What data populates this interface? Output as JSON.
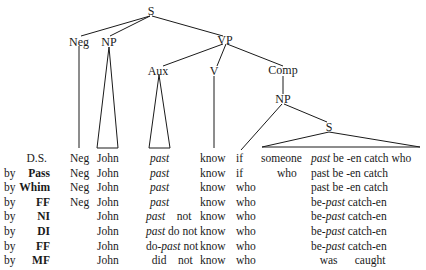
{
  "tree": {
    "nodes": {
      "S_root": "S",
      "Neg": "Neg",
      "NP": "NP",
      "VP": "VP",
      "Aux": "Aux",
      "V": "V",
      "Comp": "Comp",
      "NP_comp": "NP",
      "S_embedded": "S"
    }
  },
  "derivation": {
    "rows": [
      {
        "by": "",
        "rule": "D.S.",
        "neg": "Neg",
        "np": "John",
        "aux": "past",
        "aux_parts": [],
        "verb": "know",
        "comp": "if",
        "subj": "someone",
        "embedded": "past be -en catch who",
        "embedded_parts": [
          {
            "t": "past",
            "i": true
          },
          {
            "t": " be -en catch who",
            "i": false
          }
        ]
      },
      {
        "by": "by",
        "rule": "Pass",
        "neg": "Neg",
        "np": "John",
        "aux": "past",
        "verb": "know",
        "comp": "if",
        "subj": "who",
        "embedded_parts": [
          {
            "t": "past be -en catch",
            "i": false
          }
        ]
      },
      {
        "by": "by",
        "rule": "Whim",
        "neg": "Neg",
        "np": "John",
        "aux": "past",
        "verb": "know",
        "comp": "who",
        "subj": "",
        "embedded_parts": [
          {
            "t": "past be -en catch",
            "i": false
          }
        ]
      },
      {
        "by": "by",
        "rule": "FF",
        "neg": "Neg",
        "np": "John",
        "aux": "past",
        "verb": "know",
        "comp": "who",
        "subj": "",
        "embedded_parts": [
          {
            "t": "be-",
            "i": false
          },
          {
            "t": "past",
            "i": true
          },
          {
            "t": " catch-en",
            "i": false
          }
        ]
      },
      {
        "by": "by",
        "rule": "NI",
        "neg": "",
        "np": "John",
        "aux_parts": [
          {
            "t": "past",
            "i": true
          },
          {
            "t": "    not",
            "i": false
          }
        ],
        "verb": "know",
        "comp": "who",
        "subj": "",
        "embedded_parts": [
          {
            "t": "be-",
            "i": false
          },
          {
            "t": "past",
            "i": true
          },
          {
            "t": " catch-en",
            "i": false
          }
        ]
      },
      {
        "by": "by",
        "rule": "DI",
        "neg": "",
        "np": "John",
        "aux_parts": [
          {
            "t": "past",
            "i": true
          },
          {
            "t": " do not",
            "i": false
          }
        ],
        "verb": "know",
        "comp": "who",
        "subj": "",
        "embedded_parts": [
          {
            "t": "be-",
            "i": false
          },
          {
            "t": "past",
            "i": true
          },
          {
            "t": " catch-en",
            "i": false
          }
        ]
      },
      {
        "by": "by",
        "rule": "FF",
        "neg": "",
        "np": "John",
        "aux_parts": [
          {
            "t": "do-",
            "i": false
          },
          {
            "t": "past",
            "i": true
          },
          {
            "t": " not",
            "i": false
          }
        ],
        "verb": "know",
        "comp": "who",
        "subj": "",
        "embedded_parts": [
          {
            "t": "be-",
            "i": false
          },
          {
            "t": "past",
            "i": true
          },
          {
            "t": " catch-en",
            "i": false
          }
        ]
      },
      {
        "by": "by",
        "rule": "MF",
        "neg": "",
        "np": "John",
        "aux_parts": [
          {
            "t": "  did    not",
            "i": false
          }
        ],
        "verb": "know",
        "comp": "who",
        "subj": "",
        "embedded_parts": [
          {
            "t": "   was      caught",
            "i": false
          }
        ]
      }
    ]
  }
}
